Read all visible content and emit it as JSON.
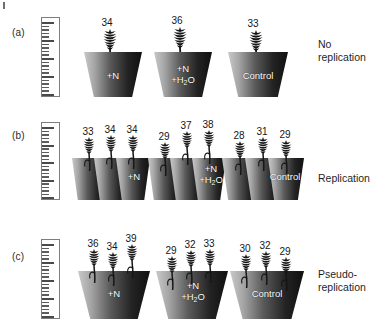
{
  "figure": {
    "treatment_labels": [
      "+N",
      "+N\n+H₂O",
      "Control"
    ],
    "panels": [
      {
        "id": "a",
        "panel_label": "(a)",
        "caption": "No\nreplication",
        "design": "one pot per treatment, one plant per pot",
        "groups": [
          {
            "treatment": "+N",
            "values": [
              34
            ]
          },
          {
            "treatment": "+N +H2O",
            "values": [
              36
            ]
          },
          {
            "treatment": "Control",
            "values": [
              33
            ]
          }
        ]
      },
      {
        "id": "b",
        "panel_label": "(b)",
        "caption": "Replication",
        "design": "three separate pots per treatment, one plant per pot",
        "groups": [
          {
            "treatment": "+N",
            "values": [
              33,
              34,
              34
            ]
          },
          {
            "treatment": "+N +H2O",
            "values": [
              29,
              37,
              38
            ]
          },
          {
            "treatment": "Control",
            "values": [
              28,
              31,
              29
            ]
          }
        ]
      },
      {
        "id": "c",
        "panel_label": "(c)",
        "caption": "Pseudo-\nreplication",
        "design": "one pot per treatment, three plants per pot",
        "groups": [
          {
            "treatment": "+N",
            "values": [
              36,
              34,
              39
            ]
          },
          {
            "treatment": "+N +H2O",
            "values": [
              29,
              32,
              33
            ]
          },
          {
            "treatment": "Control",
            "values": [
              30,
              32,
              29
            ]
          }
        ]
      }
    ],
    "ruler": {
      "name": "measuring-scale",
      "minor_ticks": 20,
      "major_every": 5
    },
    "colors": {
      "pot_dark": "#101010",
      "pot_light": "#c9c9c9",
      "ink": "#161616",
      "label_text": "#ffffff",
      "ruler_outline": "#7d7d7d"
    }
  }
}
